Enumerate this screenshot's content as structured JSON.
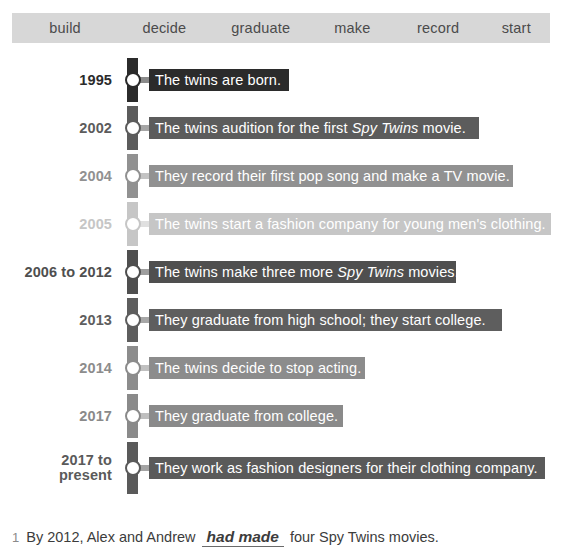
{
  "word_bank": {
    "words": [
      "build",
      "decide",
      "graduate",
      "make",
      "record",
      "start"
    ],
    "band_color": "#d7d7d7"
  },
  "timeline": {
    "rows": [
      {
        "year": "1995",
        "text_before": "The twins are born.",
        "text_italic": "",
        "text_after": "",
        "color": "#2b2b2b",
        "bar_width": 140
      },
      {
        "year": "2002",
        "text_before": "The twins audition for the first ",
        "text_italic": "Spy Twins",
        "text_after": " movie.",
        "color": "#5c5c5c",
        "bar_width": 330
      },
      {
        "year": "2004",
        "text_before": "They record their first pop song and make a TV movie.",
        "text_italic": "",
        "text_after": "",
        "color": "#919191",
        "bar_width": 364
      },
      {
        "year": "2005",
        "text_before": "The twins start a fashion company for young men's clothing.",
        "text_italic": "",
        "text_after": "",
        "color": "#c6c6c6",
        "bar_width": 402
      },
      {
        "year": "2006 to 2012",
        "text_before": "The twins make three more ",
        "text_italic": "Spy Twins",
        "text_after": " movies.",
        "color": "#4f4f4f",
        "bar_width": 307
      },
      {
        "year": "2013",
        "text_before": "They graduate from high school; they start college.",
        "text_italic": "",
        "text_after": "",
        "color": "#5e5e5e",
        "bar_width": 353
      },
      {
        "year": "2014",
        "text_before": "The twins decide to stop acting.",
        "text_italic": "",
        "text_after": "",
        "color": "#8c8c8c",
        "bar_width": 216
      },
      {
        "year": "2017",
        "text_before": "They graduate from college.",
        "text_italic": "",
        "text_after": "",
        "color": "#8a8a8a",
        "bar_width": 194
      },
      {
        "year": "2017 to present",
        "text_before": "They work as fashion designers for their clothing company.",
        "text_italic": "",
        "text_after": "",
        "color": "#5a5a5a",
        "bar_width": 396
      }
    ]
  },
  "exercise": {
    "number": "1",
    "text_before": "By 2012, Alex and Andrew",
    "answer": "had made",
    "text_after": "four Spy Twins movies."
  }
}
